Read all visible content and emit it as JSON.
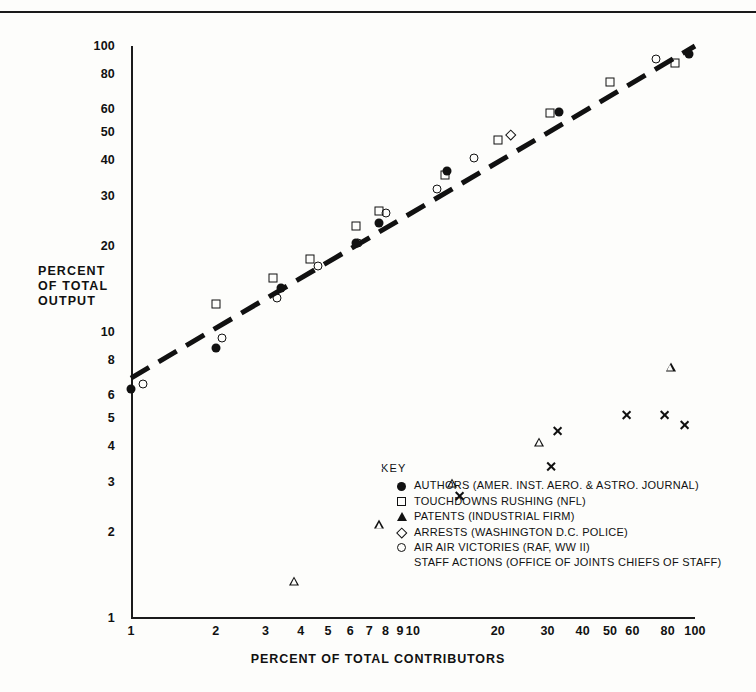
{
  "chart_data": {
    "type": "scatter",
    "title": "",
    "xlabel": "PERCENT OF TOTAL CONTRIBUTORS",
    "ylabel": "PERCENT OF TOTAL OUTPUT",
    "ylabel_lines": [
      "PERCENT",
      "OF TOTAL",
      "OUTPUT"
    ],
    "xscale": "log",
    "yscale": "log",
    "xlim": [
      1,
      100
    ],
    "ylim": [
      1,
      100
    ],
    "grid": false,
    "legend_position": "inside-lower-right",
    "xticks": [
      1,
      2,
      3,
      4,
      5,
      6,
      7,
      8,
      9,
      10,
      20,
      30,
      40,
      50,
      60,
      80,
      100
    ],
    "xticklabels": [
      "1",
      "2",
      "3",
      "4",
      "5",
      "6",
      "7",
      "8",
      "9",
      "10",
      "20",
      "30",
      "40",
      "50",
      "60",
      "80",
      "100"
    ],
    "xticks_minor": [
      70,
      90
    ],
    "yticks": [
      1,
      2,
      3,
      4,
      5,
      6,
      8,
      10,
      20,
      30,
      40,
      50,
      60,
      80,
      100
    ],
    "yticklabels": [
      "1",
      "2",
      "3",
      "4",
      "5",
      "6",
      "8",
      "10",
      "20",
      "30",
      "40",
      "50",
      "60",
      "80",
      "100"
    ],
    "yticks_minor": [
      7,
      9,
      70,
      90
    ],
    "legend_title": "KEY",
    "trendline": {
      "style": "dashed",
      "width": 5,
      "color": "#111111",
      "points": [
        [
          1.0,
          6.9
        ],
        [
          100.0,
          100.0
        ]
      ]
    },
    "series": [
      {
        "name": "AUTHORS (AMER. INST. AERO. & ASTRO. JOURNAL)",
        "marker": "filled-circle",
        "color": "#111111",
        "points": [
          [
            1.0,
            6.3
          ],
          [
            2.0,
            8.8
          ],
          [
            3.4,
            14.2
          ],
          [
            6.3,
            20.5
          ],
          [
            7.6,
            24.0
          ],
          [
            13.2,
            36.5
          ],
          [
            33.0,
            59.0
          ],
          [
            95.0,
            94.0
          ]
        ]
      },
      {
        "name": "TOUCHDOWNS RUSHING (NFL)",
        "marker": "square",
        "color": "#111111",
        "points": [
          [
            2.0,
            12.5
          ],
          [
            3.2,
            15.5
          ],
          [
            4.3,
            18.0
          ],
          [
            6.3,
            23.5
          ],
          [
            7.6,
            26.5
          ],
          [
            13.0,
            35.5
          ],
          [
            20.0,
            47.0
          ],
          [
            30.5,
            58.5
          ],
          [
            50.0,
            75.0
          ],
          [
            85.0,
            87.0
          ]
        ]
      },
      {
        "name": "PATENTS (INDUSTRIAL FIRM)",
        "marker": "triangle",
        "color": "#111111",
        "points": [
          [
            3.8,
            11.8
          ],
          [
            7.6,
            20.0
          ],
          [
            13.8,
            30.0
          ],
          [
            28.0,
            45.0
          ],
          [
            82.0,
            88.0
          ]
        ]
      },
      {
        "name": "ARRESTS (WASHINGTON D.C. POLICE)",
        "marker": "diamond",
        "color": "#111111",
        "points": [
          [
            21.5,
            50.5
          ]
        ]
      },
      {
        "name": "AIR AIR VICTORIES (RAF, WW II)",
        "marker": "open-circle",
        "color": "#111111",
        "points": [
          [
            1.1,
            6.6
          ],
          [
            2.1,
            9.5
          ],
          [
            3.3,
            13.2
          ],
          [
            4.6,
            17.0
          ],
          [
            6.4,
            20.5
          ],
          [
            8.0,
            26.0
          ],
          [
            12.2,
            31.5
          ],
          [
            16.5,
            40.5
          ],
          [
            73.0,
            90.0
          ]
        ]
      },
      {
        "name": "STAFF ACTIONS (OFFICE OF JOINTS CHIEFS OF STAFF)",
        "marker": "x",
        "color": "#111111",
        "points": [
          [
            14.6,
            33.5
          ],
          [
            32.5,
            62.0
          ],
          [
            57.0,
            77.0
          ],
          [
            78.0,
            84.0
          ],
          [
            92.0,
            84.5
          ]
        ]
      }
    ]
  },
  "legend": {
    "title": "KEY",
    "entries": [
      {
        "marker": "filled-circle",
        "label": "AUTHORS (AMER. INST. AERO. & ASTRO. JOURNAL)"
      },
      {
        "marker": "square",
        "label": "TOUCHDOWNS RUSHING (NFL)"
      },
      {
        "marker": "triangle",
        "label": "PATENTS (INDUSTRIAL FIRM)"
      },
      {
        "marker": "diamond",
        "label": "ARRESTS (WASHINGTON D.C. POLICE)"
      },
      {
        "marker": "open-circle",
        "label": "AIR AIR VICTORIES (RAF, WW II)"
      },
      {
        "marker": "x",
        "label": "STAFF ACTIONS (OFFICE OF JOINTS CHIEFS OF STAFF)"
      }
    ]
  }
}
